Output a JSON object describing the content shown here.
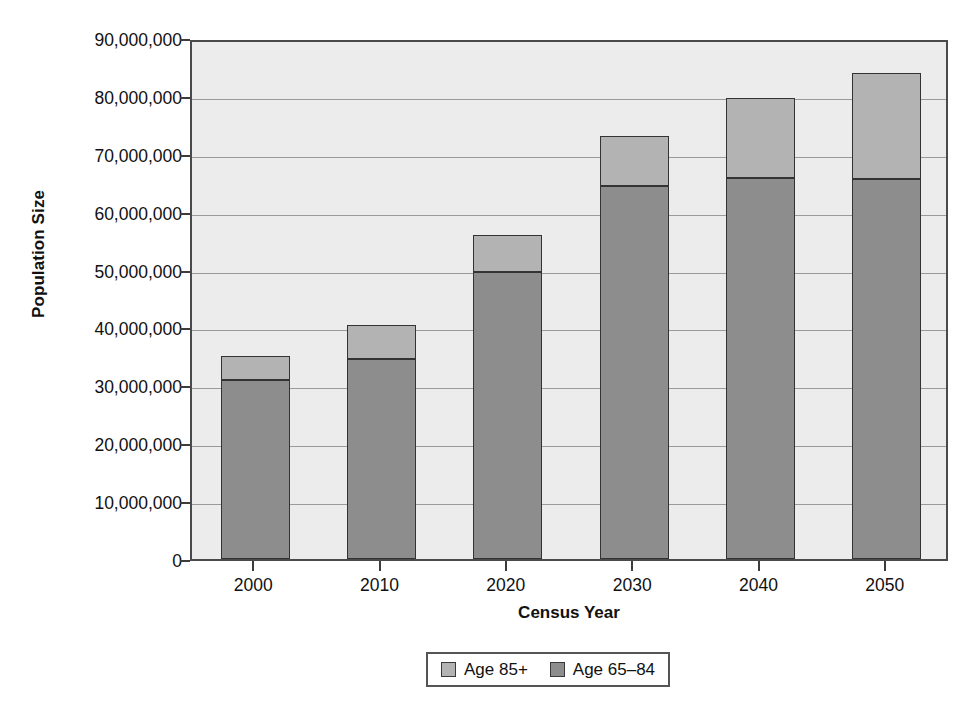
{
  "chart_data": {
    "type": "bar",
    "subtype": "stacked",
    "title": "",
    "xlabel": "Census Year",
    "ylabel": "Population Size",
    "categories": [
      "2000",
      "2010",
      "2020",
      "2030",
      "2040",
      "2050"
    ],
    "series": [
      {
        "name": "Age 65-84",
        "color": "#8d8d8d",
        "values": [
          31000000,
          34600000,
          49600000,
          64500000,
          65800000,
          65700000
        ]
      },
      {
        "name": "Age 85+",
        "color": "#b3b3b3",
        "values": [
          4000000,
          5800000,
          6400000,
          8500000,
          13900000,
          18300000
        ]
      }
    ],
    "totals": [
      35000000,
      40400000,
      56000000,
      73000000,
      79700000,
      84000000
    ],
    "ylim": [
      0,
      90000000
    ],
    "yticks": [
      0,
      10000000,
      20000000,
      30000000,
      40000000,
      50000000,
      60000000,
      70000000,
      80000000,
      90000000
    ],
    "ytick_labels": [
      "0",
      "10,000,000",
      "20,000,000",
      "30,000,000",
      "40,000,000",
      "50,000,000",
      "60,000,000",
      "70,000,000",
      "80,000,000",
      "90,000,000"
    ],
    "grid": true,
    "grid_axis": "y",
    "legend_position": "bottom",
    "legend_entries": [
      {
        "label": "Age 85+",
        "color": "#b3b3b3"
      },
      {
        "label": "Age 65–84",
        "color": "#8d8d8d"
      }
    ],
    "plot_background": "#ececec",
    "axis_color": "#4a4a4a"
  },
  "caption": "",
  "axes": {
    "y_title": "Population Size",
    "x_title": "Census Year"
  }
}
